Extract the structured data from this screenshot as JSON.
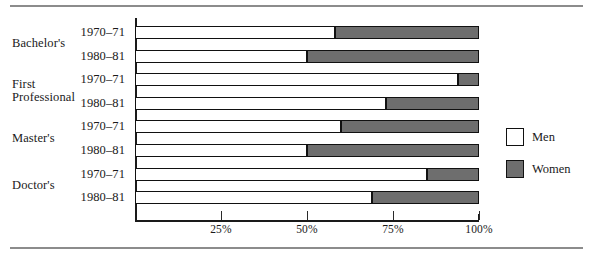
{
  "chart_data": {
    "type": "bar",
    "orientation": "horizontal",
    "stacked": true,
    "normalized": true,
    "title": "",
    "subtitle": "",
    "xlabel": "",
    "ylabel": "",
    "xlim": [
      0,
      100
    ],
    "grid": false,
    "legend_position": "right",
    "tick_labels": [
      "25%",
      "50%",
      "75%",
      "100%"
    ],
    "tick_values": [
      25,
      50,
      75,
      100
    ],
    "groups": [
      {
        "label": "Bachelor's",
        "rows": [
          0,
          1
        ]
      },
      {
        "label": "First\nProfessional",
        "rows": [
          2,
          3
        ]
      },
      {
        "label": "Master's",
        "rows": [
          4,
          5
        ]
      },
      {
        "label": "Doctor's",
        "rows": [
          6,
          7
        ]
      }
    ],
    "categories": [
      "1970–71",
      "1980–81",
      "1970–71",
      "1980–81",
      "1970–71",
      "1980–81",
      "1970–71",
      "1980–81"
    ],
    "series": [
      {
        "name": "Men",
        "color": "#ffffff",
        "values": [
          58,
          50,
          94,
          73,
          60,
          50,
          85,
          69
        ]
      },
      {
        "name": "Women",
        "color": "#6e6e6e",
        "values": [
          42,
          50,
          6,
          27,
          40,
          50,
          15,
          31
        ]
      }
    ],
    "legend": [
      {
        "label": "Men",
        "color": "#ffffff"
      },
      {
        "label": "Women",
        "color": "#6e6e6e"
      }
    ]
  },
  "rows": [
    {
      "group": "Bachelor's",
      "period": "1970–71",
      "men": 58,
      "women": 42
    },
    {
      "group": "Bachelor's",
      "period": "1980–81",
      "men": 50,
      "women": 50
    },
    {
      "group": "First Professional",
      "period": "1970–71",
      "men": 94,
      "women": 6
    },
    {
      "group": "First Professional",
      "period": "1980–81",
      "men": 73,
      "women": 27
    },
    {
      "group": "Master's",
      "period": "1970–71",
      "men": 60,
      "women": 40
    },
    {
      "group": "Master's",
      "period": "1980–81",
      "men": 50,
      "women": 50
    },
    {
      "group": "Doctor's",
      "period": "1970–71",
      "men": 85,
      "women": 15
    },
    {
      "group": "Doctor's",
      "period": "1980–81",
      "men": 69,
      "women": 31
    }
  ],
  "group_labels": [
    {
      "line1": "Bachelor's",
      "line2": ""
    },
    {
      "line1": "First",
      "line2": "Professional"
    },
    {
      "line1": "Master's",
      "line2": ""
    },
    {
      "line1": "Doctor's",
      "line2": ""
    }
  ],
  "axis": {
    "ticks": [
      {
        "label": "25%",
        "value": 25
      },
      {
        "label": "50%",
        "value": 50
      },
      {
        "label": "75%",
        "value": 75
      },
      {
        "label": "100%",
        "value": 100
      }
    ]
  },
  "colors": {
    "men": "#ffffff",
    "women": "#6e6e6e",
    "outline": "#111111",
    "rule": "#8c8c8c"
  }
}
